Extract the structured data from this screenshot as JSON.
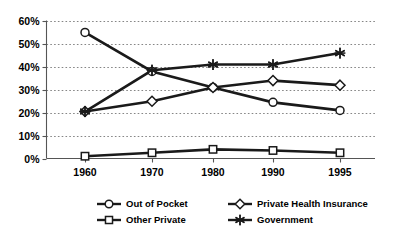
{
  "chart_data": {
    "type": "line",
    "title": "",
    "subtitle": "",
    "xlabel": "",
    "ylabel": "",
    "categories": [
      "1960",
      "1970",
      "1980",
      "1990",
      "1995"
    ],
    "x": [
      1960,
      1970,
      1980,
      1990,
      1995
    ],
    "ylim": [
      0,
      60
    ],
    "ytick_labels": [
      "0%",
      "10%",
      "20%",
      "30%",
      "40%",
      "50%",
      "60%"
    ],
    "ytick_values": [
      0,
      10,
      20,
      30,
      40,
      50,
      60
    ],
    "grid": "horizontal-dotted",
    "legend_position": "bottom",
    "series": [
      {
        "name": "Out of Pocket",
        "marker": "circle",
        "values": [
          55,
          38,
          31,
          24.5,
          21
        ]
      },
      {
        "name": "Private Health Insurance",
        "marker": "diamond",
        "values": [
          20.5,
          25,
          31,
          34,
          32
        ]
      },
      {
        "name": "Other Private",
        "marker": "square",
        "values": [
          1,
          2.5,
          4,
          3.5,
          2.5
        ]
      },
      {
        "name": "Government",
        "marker": "star",
        "values": [
          20.5,
          38.5,
          41,
          41,
          46
        ]
      }
    ],
    "colors": {
      "line": "#1a1a1a",
      "marker_fill": "#ffffff",
      "grid": "#777777",
      "axis": "#555555",
      "background": "#ffffff"
    }
  },
  "legend": {
    "entries": [
      {
        "label": "Out of Pocket",
        "marker": "circle"
      },
      {
        "label": "Private Health Insurance",
        "marker": "diamond"
      },
      {
        "label": "Other Private",
        "marker": "square"
      },
      {
        "label": "Government",
        "marker": "star"
      }
    ]
  }
}
